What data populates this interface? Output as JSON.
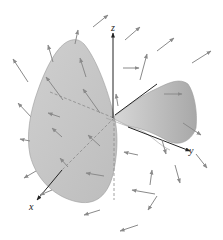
{
  "figure": {
    "type": "3d-vector-field-with-surface",
    "axes": {
      "x_label": "x",
      "y_label": "y",
      "z_label": "z"
    },
    "colors": {
      "surface": "#c8c8c8",
      "surface_dark": "#a9a9a9",
      "arrows": "#8a8a8a",
      "axes": "#222222",
      "background": "#ffffff"
    }
  }
}
